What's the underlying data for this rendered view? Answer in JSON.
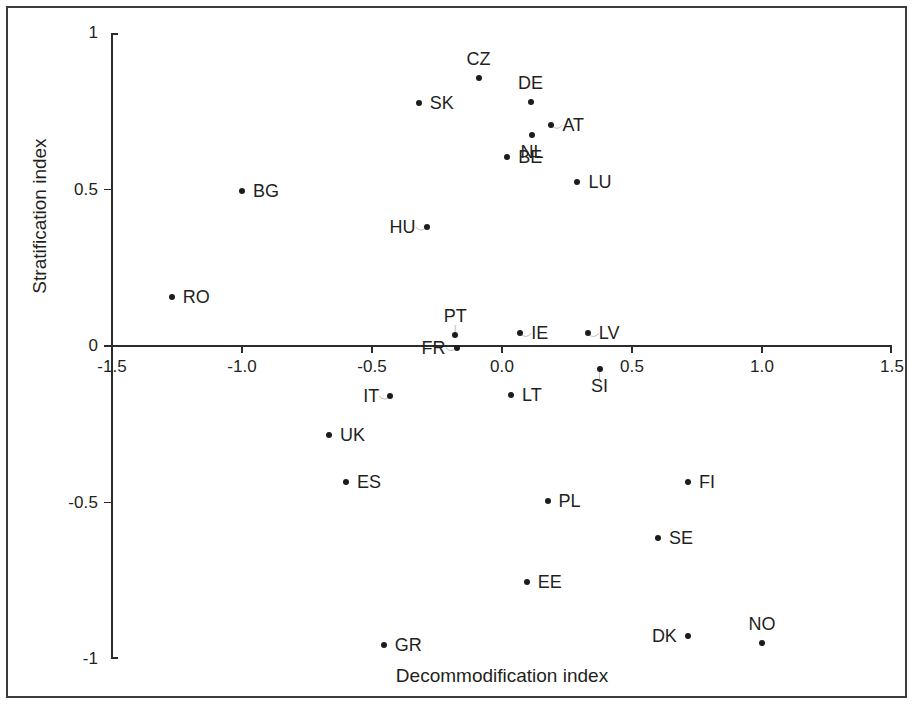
{
  "figure": {
    "type": "scatter-plot",
    "background_color": "#ffffff",
    "axis_color": "#2b2b2b",
    "marker_color": "#1c1c1c",
    "frame_color": "#3c3c3c"
  },
  "axes": {
    "x_title": "Decommodification index",
    "y_title": "Stratification index",
    "x_ticks": [
      "-1.5",
      "-1.0",
      "-0.5",
      "0.0",
      "0.5",
      "1.0",
      "1.5"
    ],
    "y_ticks": [
      "1",
      "0.5",
      "0",
      "-0.5",
      "-1"
    ]
  },
  "chart_data": {
    "type": "scatter",
    "title": "",
    "subtitle": "",
    "xlabel": "Decommodification index",
    "ylabel": "Stratification index",
    "xlim": [
      -1.5,
      1.5
    ],
    "ylim": [
      -1,
      1
    ],
    "xticks": [
      -1.5,
      -1.0,
      -0.5,
      0.0,
      0.5,
      1.0,
      1.5
    ],
    "yticks": [
      1,
      0.5,
      0,
      -0.5,
      -1
    ],
    "xtick_labels": [
      "-1.5",
      "-1.0",
      "-0.5",
      "0.0",
      "0.5",
      "1.0",
      "1.5"
    ],
    "ytick_labels": [
      "1",
      "0.5",
      "0",
      "-0.5",
      "-1"
    ],
    "grid": false,
    "legend": false,
    "legend_position": "none",
    "point_label_field": "label",
    "points": [
      {
        "label": "CZ",
        "x": -0.09,
        "y": 0.855,
        "label_pos": "above",
        "leader": false
      },
      {
        "label": "DE",
        "x": 0.11,
        "y": 0.78,
        "label_pos": "above",
        "leader": false
      },
      {
        "label": "AT",
        "x": 0.19,
        "y": 0.705,
        "label_pos": "right",
        "leader": true
      },
      {
        "label": "SK",
        "x": -0.32,
        "y": 0.775,
        "label_pos": "right",
        "leader": false
      },
      {
        "label": "NL",
        "x": 0.115,
        "y": 0.675,
        "label_pos": "below",
        "leader": false
      },
      {
        "label": "BE",
        "x": 0.02,
        "y": 0.605,
        "label_pos": "right",
        "leader": false
      },
      {
        "label": "LU",
        "x": 0.29,
        "y": 0.525,
        "label_pos": "right",
        "leader": false
      },
      {
        "label": "BG",
        "x": -1.0,
        "y": 0.495,
        "label_pos": "right",
        "leader": false
      },
      {
        "label": "HU",
        "x": -0.29,
        "y": 0.38,
        "label_pos": "left",
        "leader": true
      },
      {
        "label": "RO",
        "x": -1.27,
        "y": 0.155,
        "label_pos": "right",
        "leader": false
      },
      {
        "label": "PT",
        "x": -0.18,
        "y": 0.035,
        "label_pos": "above",
        "leader": true
      },
      {
        "label": "IE",
        "x": 0.07,
        "y": 0.04,
        "label_pos": "right",
        "leader": true
      },
      {
        "label": "LV",
        "x": 0.33,
        "y": 0.04,
        "label_pos": "right",
        "leader": true
      },
      {
        "label": "FR",
        "x": -0.175,
        "y": -0.005,
        "label_pos": "left",
        "leader": true
      },
      {
        "label": "SI",
        "x": 0.375,
        "y": -0.075,
        "label_pos": "below",
        "leader": true
      },
      {
        "label": "LT",
        "x": 0.035,
        "y": -0.155,
        "label_pos": "right",
        "leader": false
      },
      {
        "label": "IT",
        "x": -0.43,
        "y": -0.16,
        "label_pos": "left",
        "leader": true
      },
      {
        "label": "UK",
        "x": -0.665,
        "y": -0.285,
        "label_pos": "right",
        "leader": false
      },
      {
        "label": "ES",
        "x": -0.6,
        "y": -0.435,
        "label_pos": "right",
        "leader": false
      },
      {
        "label": "FI",
        "x": 0.715,
        "y": -0.435,
        "label_pos": "right",
        "leader": false
      },
      {
        "label": "PL",
        "x": 0.175,
        "y": -0.495,
        "label_pos": "right",
        "leader": false
      },
      {
        "label": "SE",
        "x": 0.6,
        "y": -0.615,
        "label_pos": "right",
        "leader": false
      },
      {
        "label": "EE",
        "x": 0.095,
        "y": -0.755,
        "label_pos": "right",
        "leader": false
      },
      {
        "label": "DK",
        "x": 0.715,
        "y": -0.925,
        "label_pos": "left",
        "leader": false
      },
      {
        "label": "NO",
        "x": 1.0,
        "y": -0.95,
        "label_pos": "above",
        "leader": false
      },
      {
        "label": "GR",
        "x": -0.455,
        "y": -0.955,
        "label_pos": "right",
        "leader": false
      }
    ]
  }
}
